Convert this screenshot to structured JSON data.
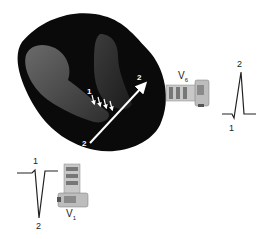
{
  "diagram": {
    "heart": {
      "depolarization_arrows_label": "1",
      "vector_label_start": "2",
      "vector_label_end": "2"
    },
    "lead_v6": {
      "name": "V",
      "subscript": "6",
      "waveform_labels": {
        "peak": "2",
        "trough": "1"
      }
    },
    "lead_v1": {
      "name": "V",
      "subscript": "1",
      "waveform_labels": {
        "peak": "1",
        "trough": "2"
      }
    },
    "colors": {
      "heart_outer": "#0a0a0a",
      "heart_chamber": "#4a4a4a",
      "vector_arrow": "#ffffff",
      "waveform": "#222222"
    }
  }
}
